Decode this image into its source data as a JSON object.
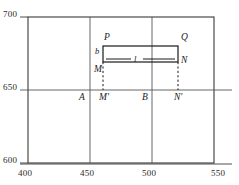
{
  "figure": {
    "type": "diagram",
    "axes": {
      "x": {
        "min": 400,
        "max": 550,
        "ticks": [
          {
            "value": 400,
            "label": "400"
          },
          {
            "value": 450,
            "label": "450"
          },
          {
            "value": 500,
            "label": "500"
          },
          {
            "value": 550,
            "label": "550"
          }
        ]
      },
      "y": {
        "min": 600,
        "max": 700,
        "ticks": [
          {
            "value": 600,
            "label": "600"
          },
          {
            "value": 650,
            "label": "650"
          },
          {
            "value": 700,
            "label": "700"
          }
        ]
      },
      "gridlines": {
        "vertical": [
          450,
          500
        ],
        "horizontal": [
          650
        ]
      }
    },
    "shape": {
      "name": "rectangle-PQNM",
      "corners": {
        "top_left": {
          "label": "P",
          "x": 460,
          "y": 672
        },
        "top_right": {
          "label": "Q",
          "x": 520,
          "y": 672
        },
        "bottom_right": {
          "label": "N",
          "x": 520,
          "y": 661
        },
        "bottom_left": {
          "label": "M",
          "x": 460,
          "y": 661
        }
      },
      "dimensions": {
        "height_label": "b",
        "length_label": "l"
      }
    },
    "projections": [
      {
        "label": "M'",
        "x": 460,
        "y": 650,
        "from": "M"
      },
      {
        "label": "N'",
        "x": 520,
        "y": 650,
        "from": "N"
      }
    ],
    "axis_points": [
      {
        "label": "A",
        "x": 450,
        "y": 650
      },
      {
        "label": "B",
        "x": 500,
        "y": 650
      }
    ],
    "colors": {
      "frame": "#3a3a3a",
      "grid": "#555555",
      "shape": "#1a1a1a",
      "text": "#1a1a1a"
    }
  }
}
